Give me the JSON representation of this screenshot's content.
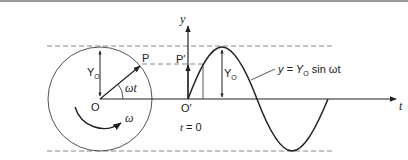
{
  "diagram": {
    "type": "phasor-to-sine-wave",
    "labels": {
      "origin": "O",
      "origin_prime": "O′",
      "point": "P",
      "point_proj": "P′",
      "amplitude": "Y",
      "amplitude_sub": "O",
      "amplitude_right": "Y",
      "amplitude_right_sub": "O",
      "angle": "ωt",
      "angular_velocity": "ω",
      "y_axis": "y",
      "t_axis": "t",
      "time_zero": "t = 0",
      "equation_prefix": "y = Y",
      "equation_sub": "O",
      "equation_suffix": " sin ωt"
    },
    "colors": {
      "line": "#2a2a2a",
      "dashed": "#888888",
      "circle": "#555555",
      "curve": "#222222"
    }
  }
}
